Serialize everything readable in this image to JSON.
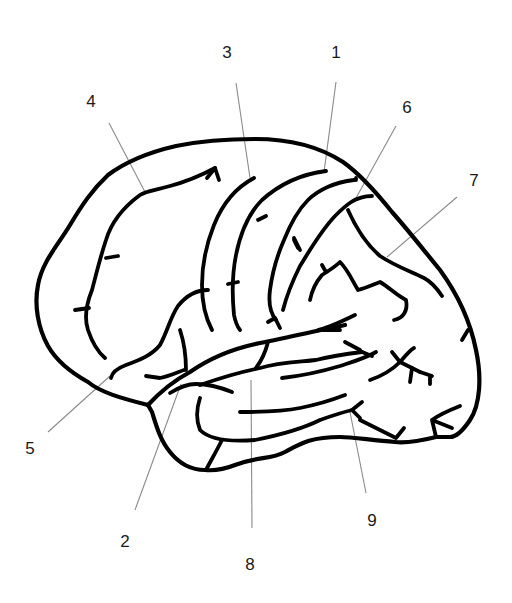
{
  "figure": {
    "type": "brain-lateral-view-line-drawing",
    "background": "#ffffff",
    "stroke_color": "#000000",
    "leader_color": "#8a8a8a"
  },
  "labels": [
    {
      "id": "1",
      "text": "1",
      "x": 336,
      "y": 52,
      "line": [
        336,
        82,
        324,
        172
      ]
    },
    {
      "id": "2",
      "text": "2",
      "x": 125,
      "y": 541,
      "line": [
        135,
        510,
        181,
        384
      ]
    },
    {
      "id": "3",
      "text": "3",
      "x": 227,
      "y": 52,
      "line": [
        236,
        83,
        250,
        178
      ]
    },
    {
      "id": "4",
      "text": "4",
      "x": 91,
      "y": 101,
      "line": [
        109,
        123,
        145,
        192
      ]
    },
    {
      "id": "5",
      "text": "5",
      "x": 30,
      "y": 448,
      "line": [
        48,
        432,
        110,
        376
      ]
    },
    {
      "id": "6",
      "text": "6",
      "x": 407,
      "y": 107,
      "line": [
        396,
        126,
        356,
        198
      ]
    },
    {
      "id": "7",
      "text": "7",
      "x": 474,
      "y": 180,
      "line": [
        457,
        197,
        387,
        257
      ]
    },
    {
      "id": "8",
      "text": "8",
      "x": 250,
      "y": 564,
      "line": [
        252,
        528,
        251,
        380
      ]
    },
    {
      "id": "9",
      "text": "9",
      "x": 372,
      "y": 520,
      "line": [
        366,
        493,
        350,
        412
      ]
    }
  ]
}
